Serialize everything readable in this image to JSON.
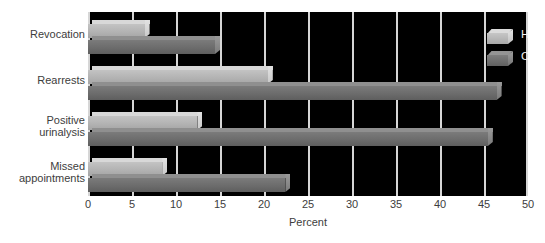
{
  "chart_data": {
    "type": "bar",
    "orientation": "horizontal",
    "title": "",
    "xlabel": "Percent",
    "ylabel": "",
    "xlim": [
      0,
      50
    ],
    "xticks": [
      0,
      5,
      10,
      15,
      20,
      25,
      30,
      35,
      40,
      45,
      50
    ],
    "grid": true,
    "legend_position": "top-right",
    "plot_background": "#000000",
    "categories": [
      "Revocation",
      "Rearrests",
      "Positive urinalysis",
      "Missed appointments"
    ],
    "category_lines": [
      [
        "Revocation"
      ],
      [
        "Rearrests"
      ],
      [
        "Positive",
        "urinalysis"
      ],
      [
        "Missed",
        "appointments"
      ]
    ],
    "series": [
      {
        "name": "HOPE group",
        "color": "#b4b4b4",
        "values": [
          7,
          21,
          13,
          9
        ]
      },
      {
        "name": "Control group",
        "color": "#6e6e6e",
        "values": [
          15,
          47,
          46,
          23
        ]
      }
    ]
  },
  "axis": {
    "tick_labels": [
      "0",
      "5",
      "10",
      "15",
      "20",
      "25",
      "30",
      "35",
      "40",
      "45",
      "50"
    ],
    "title": "Percent"
  },
  "legend": {
    "items": [
      {
        "label": "HOPE group",
        "swatch": "light-gray-cube"
      },
      {
        "label": "Control group",
        "swatch": "dark-gray-cube"
      }
    ]
  }
}
